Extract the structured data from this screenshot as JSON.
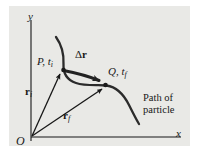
{
  "figure": {
    "name": "displacement-vector-diagram",
    "background_color": "#e9e9e6",
    "page_color": "#ffffff",
    "ink_color": "#171717",
    "curve_color": "#2b2b2b",
    "axes": {
      "y_label": "y",
      "x_label": "x",
      "origin_label": "O"
    },
    "labels": {
      "point_initial": "P, t",
      "point_initial_sub": "i",
      "point_final": "Q, t",
      "point_final_sub": "f",
      "displacement": "Δ",
      "displacement_vec": "r",
      "position_initial_vec": "r",
      "position_initial_sub": "i",
      "position_final_vec": "r",
      "position_final_sub": "f",
      "caption_line1": "Path of",
      "caption_line2": "particle"
    },
    "geometry": {
      "origin": [
        31,
        137
      ],
      "point_P": [
        62,
        70
      ],
      "point_Q": [
        106,
        85
      ],
      "y_axis_top": [
        31,
        20
      ],
      "x_axis_right": [
        180,
        137
      ]
    }
  }
}
